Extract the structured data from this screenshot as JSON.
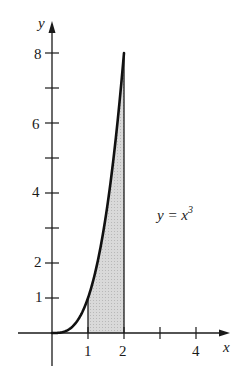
{
  "chart_data": {
    "type": "area",
    "title": "",
    "function_label": "y = x^3",
    "curve": {
      "expr": "x^3",
      "x_range": [
        0,
        2
      ]
    },
    "shaded_region": {
      "x_from": 1,
      "x_to": 2,
      "under": "y = x^3"
    },
    "xlabel": "x",
    "ylabel": "y",
    "x_ticks": [
      1,
      2,
      3,
      4
    ],
    "x_tick_labels": [
      "1",
      "2",
      "",
      "4"
    ],
    "y_ticks": [
      1,
      2,
      3,
      4,
      5,
      6,
      7,
      8
    ],
    "y_tick_labels": [
      "1",
      "2",
      "",
      "4",
      "",
      "6",
      "",
      "8"
    ],
    "xlim": [
      -1.4,
      5.0
    ],
    "ylim": [
      -1.0,
      8.7
    ],
    "grid": false,
    "colors": {
      "curve": "#111111",
      "shade": "#d4d4d4",
      "axes": "#1a1a1a"
    }
  },
  "labels": {
    "y_axis": "y",
    "x_axis": "x",
    "eq_lhs": "y = x",
    "eq_exp": "3",
    "x_tick_1": "1",
    "x_tick_2": "2",
    "x_tick_4": "4",
    "y_tick_1": "1",
    "y_tick_2": "2",
    "y_tick_4": "4",
    "y_tick_6": "6",
    "y_tick_8": "8"
  }
}
